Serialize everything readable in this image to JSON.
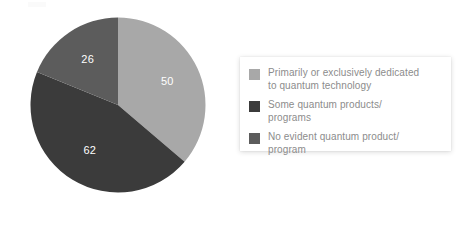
{
  "chart_data": {
    "type": "pie",
    "title": "",
    "subtitle": "",
    "xlabel": "",
    "ylabel": "",
    "legend_position": "right",
    "grid": false,
    "total": 138,
    "categories": [
      "Primarily or exclusively dedicated to quantum technology",
      "Some quantum products/ programs",
      "No evident quantum product/ program"
    ],
    "values": [
      50,
      62,
      26
    ],
    "labels": [
      "50",
      "62",
      "26"
    ],
    "colors": [
      "#a8a8a8",
      "#3b3b3b",
      "#5c5c5c"
    ],
    "slices": [
      {
        "label": "50",
        "value": 50,
        "category": "Primarily or exclusively dedicated to quantum technology",
        "color": "#a8a8a8",
        "start_angle": 0,
        "end_angle": 130.43
      },
      {
        "label": "62",
        "value": 62,
        "category": "Some quantum products/ programs",
        "color": "#3b3b3b",
        "start_angle": 130.43,
        "end_angle": 292.17
      },
      {
        "label": "26",
        "value": 26,
        "category": "No evident quantum product/ program",
        "color": "#5c5c5c",
        "start_angle": 292.17,
        "end_angle": 360
      }
    ]
  },
  "legend": {
    "items": [
      {
        "swatch_color": "#a8a8a8",
        "label": "Primarily or exclusively dedicated\nto quantum technology"
      },
      {
        "swatch_color": "#3b3b3b",
        "label": "Some quantum products/\nprograms"
      },
      {
        "swatch_color": "#5c5c5c",
        "label": "No evident quantum product/\nprogram"
      }
    ]
  }
}
